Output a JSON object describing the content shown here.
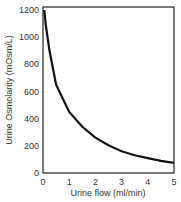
{
  "chart_data": {
    "type": "line",
    "title": "",
    "xlabel": "Urine flow (ml/min)",
    "ylabel": "Urine Osmolarity (mOsm/L)",
    "xlim": [
      0,
      5
    ],
    "ylim": [
      0,
      1200
    ],
    "xticks": [
      "0",
      "1",
      "2",
      "3",
      "4",
      "5"
    ],
    "yticks": [
      "0",
      "200",
      "400",
      "600",
      "800",
      "1000",
      "1200"
    ],
    "grid": false,
    "legend": null,
    "series": [
      {
        "name": "Urine osmolarity",
        "x": [
          0.05,
          0.1,
          0.25,
          0.5,
          1,
          1.5,
          2,
          2.5,
          3,
          3.5,
          4,
          4.5,
          5
        ],
        "y": [
          1200,
          1100,
          900,
          650,
          450,
          340,
          260,
          205,
          160,
          130,
          110,
          90,
          75
        ]
      }
    ]
  }
}
